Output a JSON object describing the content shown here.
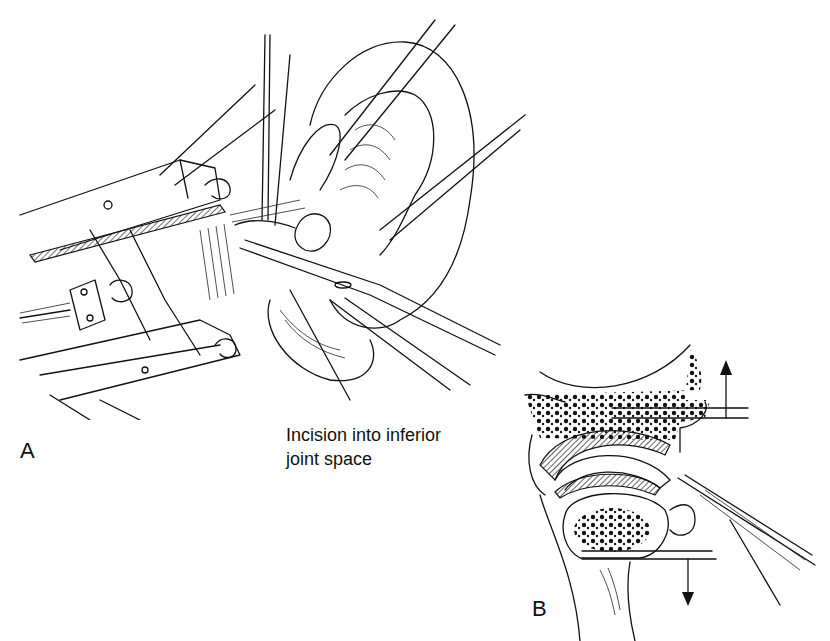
{
  "figure": {
    "panels": [
      {
        "id": "A",
        "label": "A",
        "description": "Surgical view of ear region with retractors and instruments; incision into inferior joint space",
        "annotation": {
          "line1": "Incision into inferior",
          "line2": "joint space"
        }
      },
      {
        "id": "B",
        "label": "B",
        "description": "Cross-section of joint showing disc, condyle, and instruments with up and down arrows"
      }
    ],
    "colors": {
      "ink": "#111111",
      "background": "#ffffff"
    }
  }
}
